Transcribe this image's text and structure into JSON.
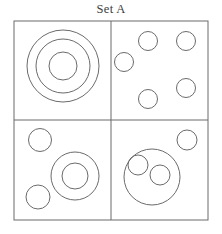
{
  "figure": {
    "title": "Set A",
    "type": "venn-like-quadrant-circle-diagram",
    "stroke_color": "#6b6b6b",
    "fill_color": "none",
    "background_color": "#ffffff",
    "stroke_width": 1,
    "frame": {
      "x": 14,
      "y": 21,
      "width": 194,
      "height": 199
    },
    "dividers": {
      "vertical_x": 111,
      "horizontal_y": 120
    },
    "quadrants": [
      {
        "name": "top-left",
        "description": "three concentric circles",
        "circle_count": 3,
        "circles": [
          {
            "cx": 63,
            "cy": 66,
            "r": 36
          },
          {
            "cx": 63,
            "cy": 66,
            "r": 27
          },
          {
            "cx": 63,
            "cy": 66,
            "r": 14
          }
        ]
      },
      {
        "name": "top-right",
        "description": "five separate small circles",
        "circle_count": 5,
        "circles": [
          {
            "cx": 148,
            "cy": 41,
            "r": 9.5
          },
          {
            "cx": 186,
            "cy": 41,
            "r": 9.5
          },
          {
            "cx": 124,
            "cy": 62,
            "r": 9.5
          },
          {
            "cx": 186,
            "cy": 88,
            "r": 9.5
          },
          {
            "cx": 148,
            "cy": 99,
            "r": 9.5
          }
        ]
      },
      {
        "name": "bottom-left",
        "description": "two separate small circles and one concentric pair",
        "circle_count": 4,
        "circles": [
          {
            "cx": 40,
            "cy": 140,
            "r": 11.5
          },
          {
            "cx": 38,
            "cy": 197,
            "r": 12
          },
          {
            "cx": 75,
            "cy": 176,
            "r": 24
          },
          {
            "cx": 75,
            "cy": 176,
            "r": 13
          }
        ]
      },
      {
        "name": "bottom-right",
        "description": "large circle containing two small circles, plus one small circle outside",
        "circle_count": 4,
        "circles": [
          {
            "cx": 187,
            "cy": 140,
            "r": 10
          },
          {
            "cx": 152,
            "cy": 177,
            "r": 28
          },
          {
            "cx": 138,
            "cy": 165,
            "r": 10
          },
          {
            "cx": 160,
            "cy": 175,
            "r": 10
          }
        ]
      }
    ]
  }
}
